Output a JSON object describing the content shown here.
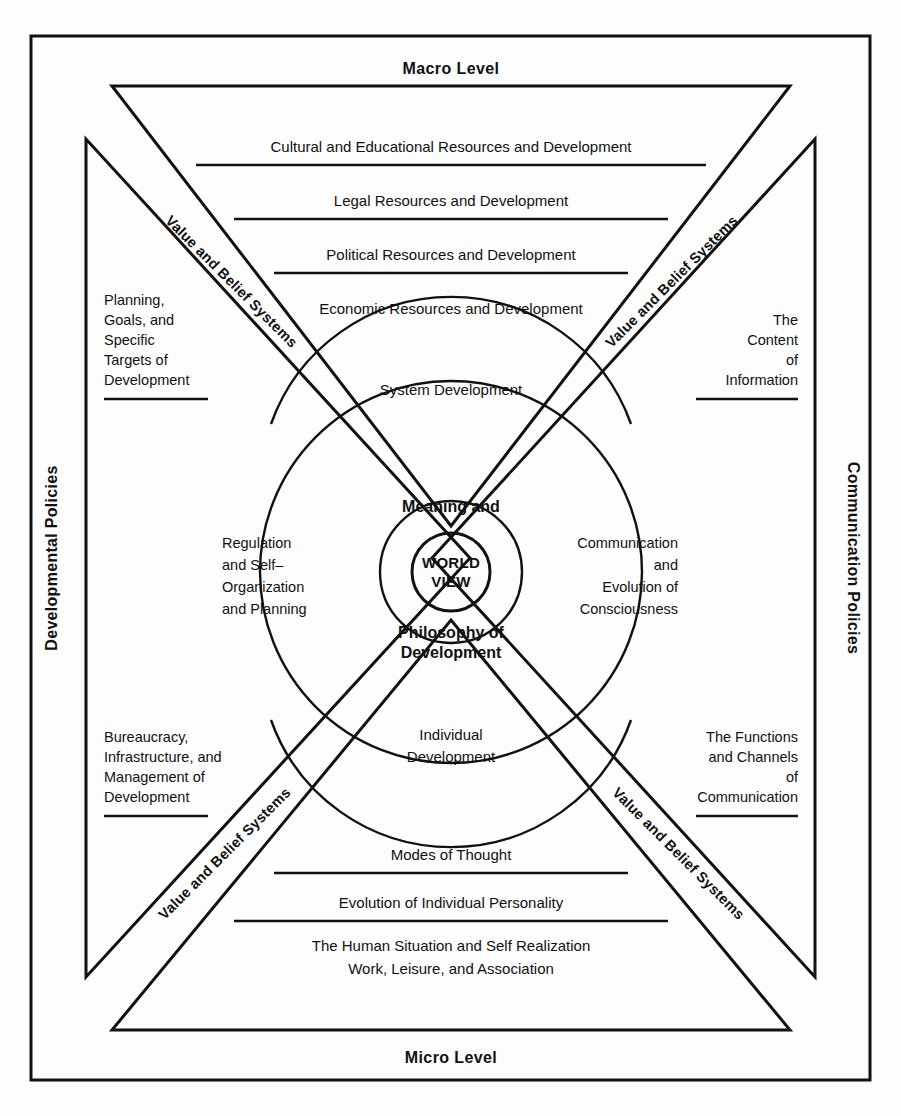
{
  "diagram": {
    "title_top": "Macro Level",
    "title_bottom": "Micro Level",
    "side_left": "Developmental Policies",
    "side_right": "Communication Policies",
    "band_label": "Value and Belief Systems",
    "bands": [
      {
        "id": "top-left",
        "label": "Value and Belief Systems"
      },
      {
        "id": "top-right",
        "label": "Value and Belief Systems"
      },
      {
        "id": "bottom-left",
        "label": "Value and Belief Systems"
      },
      {
        "id": "bottom-right",
        "label": "Value and Belief Systems"
      }
    ],
    "macro_rows": [
      "Cultural and Educational Resources and Development",
      "Legal Resources and Development",
      "Political Resources and Development",
      "Economic Resources and Development"
    ],
    "micro_rows": [
      "Modes of Thought",
      "Evolution of Individual Personality"
    ],
    "micro_tail": [
      "The Human Situation and Self Realization",
      "Work, Leisure, and Association"
    ],
    "corner_top_left": [
      "Planning,",
      "Goals, and",
      "Specific",
      "Targets of",
      "Development"
    ],
    "corner_top_right": [
      "The",
      "Content",
      "of",
      "Information"
    ],
    "corner_bottom_left": [
      "Bureaucracy,",
      "Infrastructure, and",
      "Management of",
      "Development"
    ],
    "corner_bottom_right": [
      "The Functions",
      "and Channels",
      "of",
      "Communication"
    ],
    "sector_top": "System Development",
    "sector_bottom": [
      "Individual",
      "Development"
    ],
    "quadrant_left": [
      "Regulation",
      "and Self–",
      "Organization",
      "and Planning"
    ],
    "quadrant_right": [
      "Communication",
      "and",
      "Evolution of",
      "Consciousness"
    ],
    "core_above": "Meaning and",
    "core_below": [
      "Philosophy of",
      "Development"
    ],
    "core_center": [
      "WORLD",
      "VIEW"
    ],
    "colors": {
      "ink": "#111111",
      "paper": "#fdfdfd",
      "frame": "#111111"
    }
  }
}
